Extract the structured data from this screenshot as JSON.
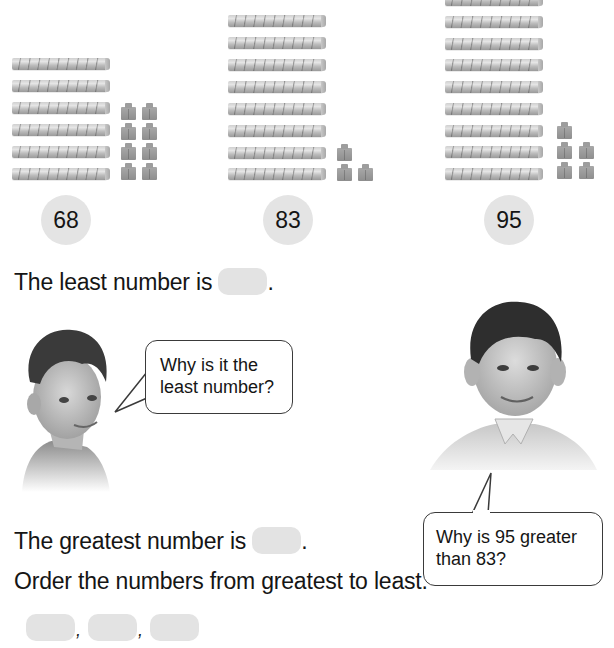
{
  "groups": [
    {
      "id": "68",
      "label": "68",
      "tens": 6,
      "ones": 8
    },
    {
      "id": "83",
      "label": "83",
      "tens": 8,
      "ones": 3
    },
    {
      "id": "95",
      "label": "95",
      "tens": 9,
      "ones": 5
    }
  ],
  "questions": {
    "least": {
      "prefix": "The least number is",
      "suffix": "."
    },
    "greatest": {
      "prefix": "The greatest number is",
      "suffix": "."
    },
    "order": {
      "instruction": "Order the numbers from greatest to least.",
      "separator": ","
    }
  },
  "speech_bubbles": {
    "left": {
      "line1": "Why is it the",
      "line2": "least number?"
    },
    "right": {
      "line1": "Why is 95 greater",
      "line2": "than 83?"
    }
  },
  "characters": {
    "left_boy": "boy-with-freckles",
    "right_boy": "boy-smiling-polo-shirt"
  },
  "colors": {
    "circle_fill": "#e4e4e4",
    "answer_blank": "#e3e3e3",
    "text": "#151515"
  }
}
